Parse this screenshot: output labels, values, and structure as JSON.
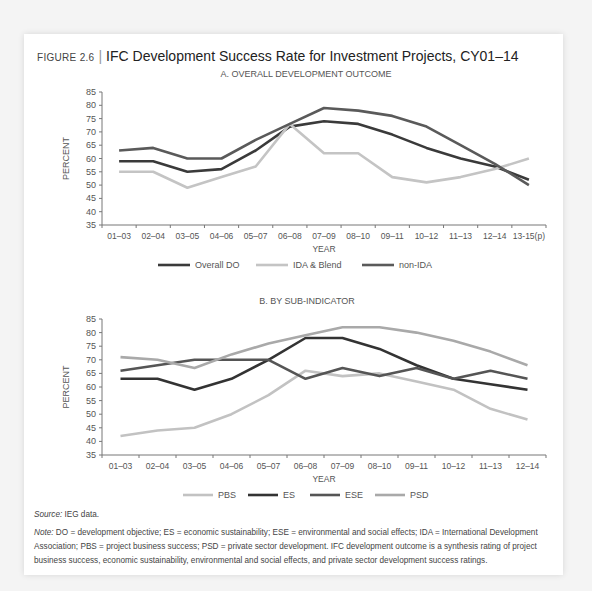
{
  "figure": {
    "number": "FIGURE 2.6",
    "title": "IFC Development Success Rate for Investment Projects, CY01–14"
  },
  "chart_data": [
    {
      "type": "line",
      "title": "A. OVERALL DEVELOPMENT OUTCOME",
      "xlabel": "YEAR",
      "ylabel": "PERCENT",
      "ylim": [
        35,
        85
      ],
      "yticks": [
        35,
        40,
        45,
        50,
        55,
        60,
        65,
        70,
        75,
        80,
        85
      ],
      "grid": false,
      "legend_position": "bottom",
      "categories": [
        "01–03",
        "02–04",
        "03–05",
        "04–06",
        "05–07",
        "06–08",
        "07–09",
        "08–10",
        "09–11",
        "10–12",
        "11–13",
        "12–14",
        "13-15(p)"
      ],
      "series": [
        {
          "name": "Overall DO",
          "color": "#3a3a3a",
          "values": [
            59,
            59,
            55,
            56,
            63,
            72,
            74,
            73,
            69,
            64,
            60,
            57,
            52
          ]
        },
        {
          "name": "IDA & Blend",
          "color": "#c4c4c4",
          "values": [
            55,
            55,
            49,
            53,
            57,
            73,
            62,
            62,
            53,
            51,
            53,
            56,
            60
          ]
        },
        {
          "name": "non-IDA",
          "color": "#5a5a5a",
          "values": [
            63,
            64,
            60,
            60,
            67,
            73,
            79,
            78,
            76,
            72,
            65,
            58,
            50
          ]
        }
      ]
    },
    {
      "type": "line",
      "title": "B. BY SUB-INDICATOR",
      "xlabel": "YEAR",
      "ylabel": "PERCENT",
      "ylim": [
        35,
        85
      ],
      "yticks": [
        35,
        40,
        45,
        50,
        55,
        60,
        65,
        70,
        75,
        80,
        85
      ],
      "grid": false,
      "legend_position": "bottom",
      "categories": [
        "01–03",
        "02–04",
        "03–05",
        "04–06",
        "05–07",
        "06–08",
        "07–09",
        "08–10",
        "09–11",
        "10–12",
        "11–13",
        "12–14"
      ],
      "series": [
        {
          "name": "PBS",
          "color": "#c2c2c2",
          "values": [
            42,
            44,
            45,
            50,
            57,
            66,
            64,
            65,
            62,
            59,
            52,
            48
          ]
        },
        {
          "name": "ES",
          "color": "#333333",
          "values": [
            63,
            63,
            59,
            63,
            70,
            78,
            78,
            74,
            68,
            63,
            61,
            59
          ]
        },
        {
          "name": "ESE",
          "color": "#555555",
          "values": [
            66,
            68,
            70,
            70,
            70,
            63,
            67,
            64,
            67,
            63,
            66,
            63
          ]
        },
        {
          "name": "PSD",
          "color": "#a9a9a9",
          "values": [
            71,
            70,
            67,
            72,
            76,
            79,
            82,
            82,
            80,
            77,
            73,
            68
          ]
        }
      ]
    }
  ],
  "notes": {
    "source_label": "Source:",
    "source_text": " IEG data.",
    "note_label": "Note:",
    "note_text": " DO = development objective; ES = economic sustainability; ESE = environmental and social effects; IDA = International Development Association; PBS = project business success; PSD = private sector development. IFC development outcome is a synthesis rating of project business success, economic sustainability, environmental and social effects, and private sector development success ratings."
  }
}
